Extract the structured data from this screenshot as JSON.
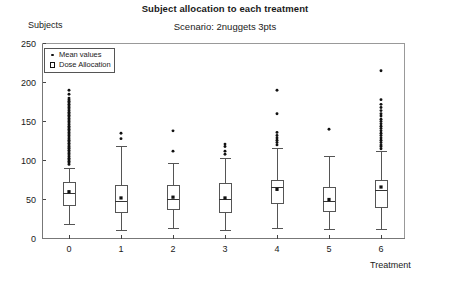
{
  "chart_data": {
    "type": "box",
    "title": "Subject allocation to each treatment",
    "subtitle": "Scenario: 2nuggets 3pts",
    "xlabel": "Treatment",
    "ylabel": "Subjects",
    "ylim": [
      0,
      250
    ],
    "yticks": [
      0,
      50,
      100,
      150,
      200,
      250
    ],
    "categories": [
      "0",
      "1",
      "2",
      "3",
      "4",
      "5",
      "6"
    ],
    "grid": false,
    "legend_position": "top-left",
    "legend": [
      {
        "label": "Mean values",
        "marker": "filled-dot"
      },
      {
        "label": "Dose Allocation",
        "marker": "open-square"
      }
    ],
    "boxes": [
      {
        "category": "0",
        "whisker_low": 18,
        "q1": 42,
        "median": 58,
        "q3": 72,
        "whisker_high": 90,
        "mean": 60,
        "outliers": [
          95,
          97,
          99,
          101,
          103,
          105,
          107,
          109,
          111,
          113,
          115,
          116,
          118,
          120,
          122,
          124,
          126,
          128,
          130,
          132,
          134,
          136,
          138,
          140,
          142,
          144,
          146,
          148,
          150,
          152,
          154,
          156,
          158,
          160,
          162,
          164,
          166,
          168,
          170,
          172,
          174,
          176,
          178,
          180,
          185,
          190
        ]
      },
      {
        "category": "1",
        "whisker_low": 10,
        "q1": 33,
        "median": 48,
        "q3": 68,
        "whisker_high": 118,
        "mean": 52,
        "outliers": [
          128,
          135
        ]
      },
      {
        "category": "2",
        "whisker_low": 13,
        "q1": 37,
        "median": 50,
        "q3": 68,
        "whisker_high": 96,
        "mean": 53,
        "outliers": [
          112,
          138
        ]
      },
      {
        "category": "3",
        "whisker_low": 10,
        "q1": 33,
        "median": 50,
        "q3": 70,
        "whisker_high": 102,
        "mean": 52,
        "outliers": [
          108,
          112,
          118,
          121
        ]
      },
      {
        "category": "4",
        "whisker_low": 13,
        "q1": 45,
        "median": 65,
        "q3": 75,
        "whisker_high": 115,
        "mean": 63,
        "outliers": [
          120,
          123,
          126,
          129,
          132,
          136,
          160,
          190
        ]
      },
      {
        "category": "5",
        "whisker_low": 12,
        "q1": 35,
        "median": 48,
        "q3": 65,
        "whisker_high": 105,
        "mean": 50,
        "outliers": [
          140
        ]
      },
      {
        "category": "6",
        "whisker_low": 12,
        "q1": 40,
        "median": 62,
        "q3": 75,
        "whisker_high": 112,
        "mean": 66,
        "outliers": [
          115,
          118,
          120,
          123,
          126,
          129,
          132,
          135,
          138,
          141,
          144,
          147,
          150,
          153,
          157,
          160,
          164,
          168,
          172,
          178,
          215
        ]
      }
    ]
  },
  "style": {
    "line_color": "#555555",
    "marker_color": "#111111",
    "frame_color": "#999999",
    "text_color": "#1a1a1a"
  }
}
